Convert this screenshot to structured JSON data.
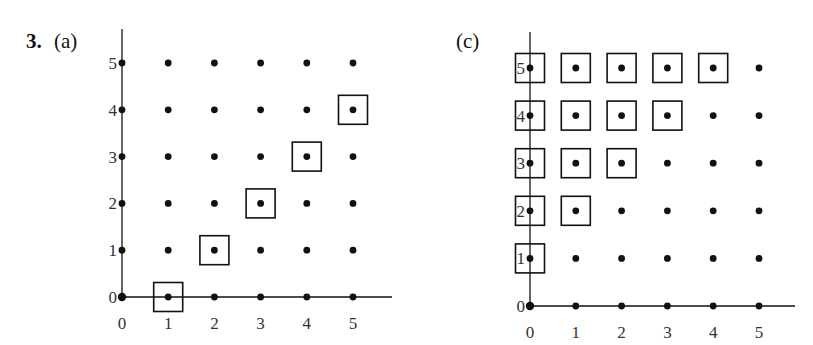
{
  "problem_number": "3.",
  "panels": [
    {
      "label": "(a)",
      "origin_px": [
        122,
        297
      ],
      "spacing_px": [
        46.2,
        46.8
      ],
      "x_ticks": [
        "0",
        "1",
        "2",
        "3",
        "4",
        "5"
      ],
      "y_ticks": [
        "0",
        "1",
        "2",
        "3",
        "4",
        "5"
      ],
      "boxed_points": [
        [
          1,
          0
        ],
        [
          2,
          1
        ],
        [
          3,
          2
        ],
        [
          4,
          3
        ],
        [
          5,
          4
        ]
      ],
      "axis_end": {
        "x": 392,
        "y_top": 29
      }
    },
    {
      "label": "(c)",
      "origin_px": [
        530,
        306
      ],
      "spacing_px": [
        45.8,
        47.6
      ],
      "x_ticks": [
        "0",
        "1",
        "2",
        "3",
        "4",
        "5"
      ],
      "y_ticks": [
        "0",
        "1",
        "2",
        "3",
        "4",
        "5"
      ],
      "boxed_points": [
        [
          0,
          1
        ],
        [
          0,
          2
        ],
        [
          0,
          3
        ],
        [
          0,
          4
        ],
        [
          0,
          5
        ],
        [
          1,
          2
        ],
        [
          1,
          3
        ],
        [
          1,
          4
        ],
        [
          1,
          5
        ],
        [
          2,
          3
        ],
        [
          2,
          4
        ],
        [
          2,
          5
        ],
        [
          3,
          4
        ],
        [
          3,
          5
        ],
        [
          4,
          5
        ]
      ],
      "axis_end": {
        "x": 795,
        "y_top": 32
      }
    }
  ],
  "colors": {
    "ink": "#111111",
    "background": "#ffffff"
  }
}
